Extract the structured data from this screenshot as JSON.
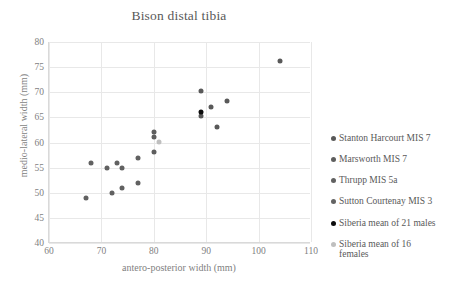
{
  "chart_data": {
    "type": "scatter",
    "title": "Bison distal tibia",
    "xlabel": "antero-posterior width (mm)",
    "ylabel": "medio-lateral width (mm)",
    "xlim": [
      60,
      110
    ],
    "ylim": [
      40,
      80
    ],
    "xticks": [
      60,
      70,
      80,
      90,
      100,
      110
    ],
    "yticks": [
      40,
      45,
      50,
      55,
      60,
      65,
      70,
      75,
      80
    ],
    "grid": true,
    "legend_position": "right",
    "series": [
      {
        "name": "Stanton Harcourt MIS 7",
        "color": "#595959",
        "points": [
          [
            104,
            76.2
          ],
          [
            89,
            70.2
          ],
          [
            94,
            68.2
          ],
          [
            91,
            67.1
          ],
          [
            92,
            63.1
          ],
          [
            89,
            65.2
          ]
        ]
      },
      {
        "name": "Marsworth MIS 7",
        "color": "#5e5e5e",
        "points": [
          [
            80,
            62.1
          ],
          [
            80,
            61.1
          ],
          [
            80,
            58.1
          ]
        ]
      },
      {
        "name": "Thrupp MIS 5a",
        "color": "#616161",
        "points": [
          [
            68,
            56.0
          ],
          [
            71,
            55.0
          ],
          [
            73,
            56.0
          ],
          [
            74,
            55.0
          ],
          [
            77,
            57.0
          ],
          [
            77,
            52.0
          ],
          [
            74,
            51.0
          ],
          [
            72,
            50.0
          ],
          [
            67,
            49.0
          ]
        ]
      },
      {
        "name": "Sutton Courtenay MIS 3",
        "color": "#636363",
        "points": []
      },
      {
        "name": "Siberia mean of 21 males",
        "color": "#0d0d0d",
        "points": [
          [
            89,
            66.0
          ]
        ]
      },
      {
        "name": "Siberia mean of 16\nfemales",
        "color": "#bfbfbf",
        "points": [
          [
            81,
            60.1
          ]
        ]
      }
    ]
  },
  "legend": {
    "items": [
      {
        "label": "Stanton Harcourt MIS 7",
        "color": "#595959"
      },
      {
        "label": "Marsworth MIS 7",
        "color": "#5e5e5e"
      },
      {
        "label": "Thrupp MIS 5a",
        "color": "#616161"
      },
      {
        "label": "Sutton Courtenay MIS 3",
        "color": "#636363"
      },
      {
        "label": "Siberia mean of 21 males",
        "color": "#0d0d0d"
      },
      {
        "label": "Siberia mean of 16\nfemales",
        "color": "#bfbfbf"
      }
    ]
  },
  "colors": {
    "gridline": "#e8e8e8",
    "axis": "#d9d9d9",
    "tick_text": "#7f7f7f",
    "title_text": "#595959"
  }
}
